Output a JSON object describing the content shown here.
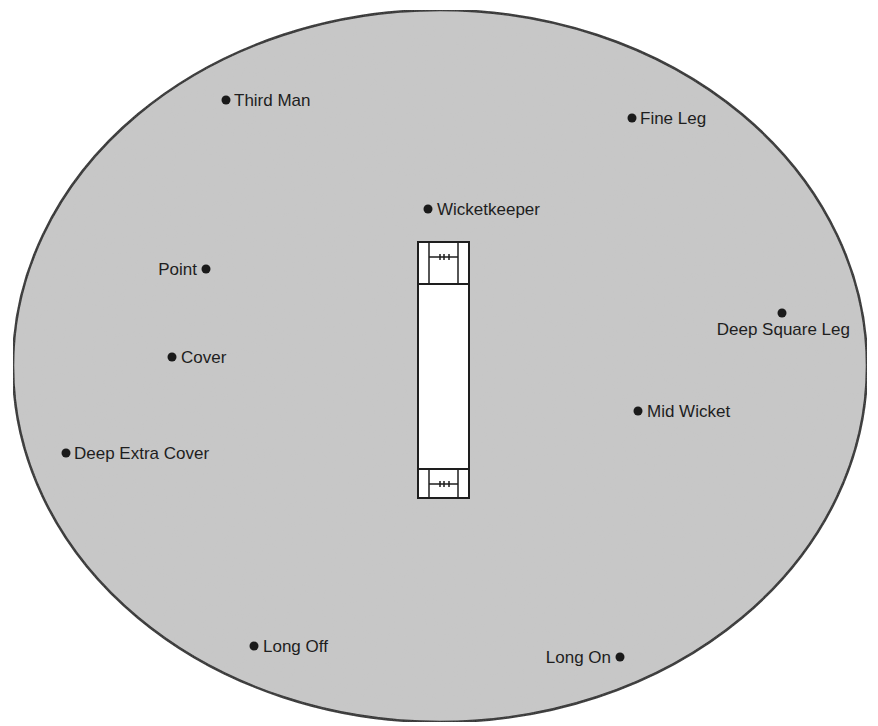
{
  "diagram": {
    "type": "cricket-field-positions",
    "colors": {
      "field_fill": "#c8c8c8",
      "field_stroke": "#2a2a2a",
      "pitch_fill": "#ffffff",
      "pitch_stroke": "#1e1e1e",
      "marker": "#1a1a1a",
      "text": "#1e1e1e"
    },
    "field": {
      "cx": 440,
      "cy": 366,
      "rx": 427,
      "ry": 356
    },
    "pitch": {
      "x": 418,
      "y": 242,
      "width": 51,
      "height": 256
    },
    "fielders": [
      {
        "label": "Third Man",
        "dot_x": 226,
        "dot_y": 100,
        "label_side": "right"
      },
      {
        "label": "Fine Leg",
        "dot_x": 632,
        "dot_y": 118,
        "label_side": "right"
      },
      {
        "label": "Wicketkeeper",
        "dot_x": 428,
        "dot_y": 209,
        "label_side": "right"
      },
      {
        "label": "Point",
        "dot_x": 206,
        "dot_y": 269,
        "label_side": "left"
      },
      {
        "label": "Deep Square Leg",
        "dot_x": 782,
        "dot_y": 313,
        "label_side": "below"
      },
      {
        "label": "Cover",
        "dot_x": 172,
        "dot_y": 357,
        "label_side": "right"
      },
      {
        "label": "Mid Wicket",
        "dot_x": 638,
        "dot_y": 411,
        "label_side": "right"
      },
      {
        "label": "Deep Extra Cover",
        "dot_x": 66,
        "dot_y": 453,
        "label_side": "right"
      },
      {
        "label": "Long Off",
        "dot_x": 254,
        "dot_y": 646,
        "label_side": "right"
      },
      {
        "label": "Long On",
        "dot_x": 620,
        "dot_y": 657,
        "label_side": "left"
      }
    ]
  }
}
